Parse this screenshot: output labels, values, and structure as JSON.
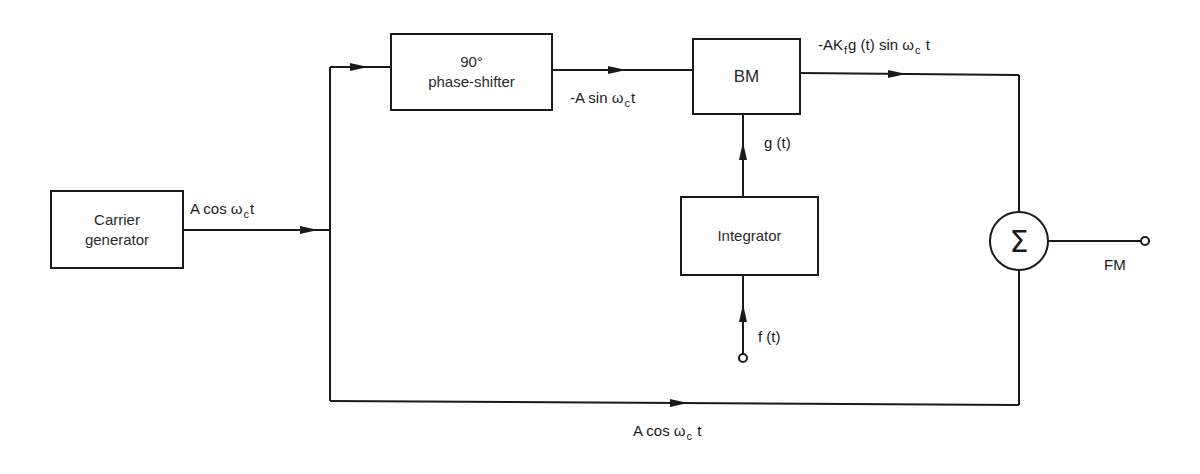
{
  "diagram": {
    "blocks": {
      "carrier_generator": {
        "line1": "Carrier",
        "line2": "generator"
      },
      "phase_shifter": {
        "line1": "90°",
        "line2": "phase-shifter"
      },
      "balanced_modulator": {
        "label": "BM"
      },
      "integrator": {
        "label": "Integrator"
      },
      "summer": {
        "symbol": "Σ"
      }
    },
    "signals": {
      "carrier_out": {
        "pre": "A cos  ω",
        "sub": "c",
        "post": "t"
      },
      "phase_shifter_out": {
        "pre": "-A sin  ω",
        "sub": "c",
        "post": "t"
      },
      "bm_out": {
        "pre1": "-AK",
        "sub1": "f",
        "mid": "g  (t) sin ω",
        "sub2": "c",
        "post": " t"
      },
      "integrator_out": {
        "text": "g (t)"
      },
      "message_in": {
        "text": "f (t)"
      },
      "bottom_path": {
        "pre": "A cos ω",
        "sub": "c",
        "post": "  t"
      },
      "output": {
        "text": "FM"
      }
    },
    "colors": {
      "line": "#1a1a1a",
      "background": "#ffffff"
    }
  }
}
